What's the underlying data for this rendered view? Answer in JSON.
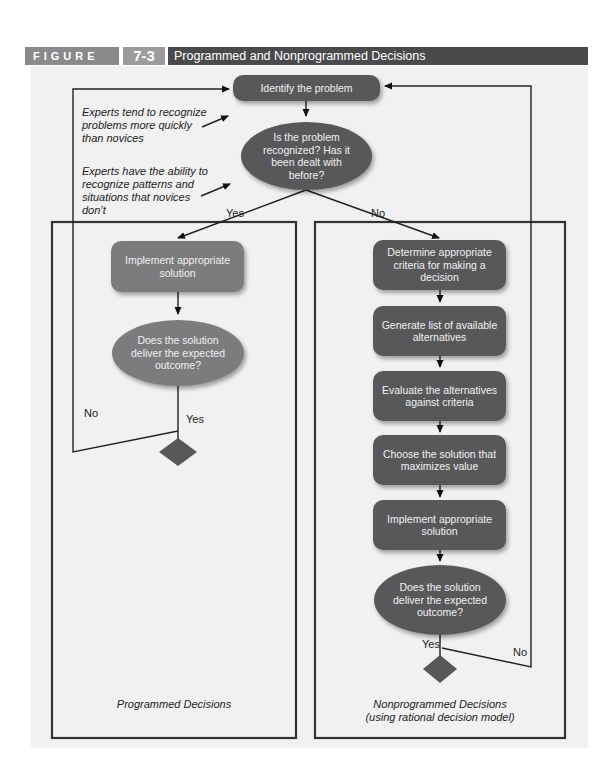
{
  "header": {
    "figure_label": "FIGURE",
    "figure_number": "7-3",
    "title": "Programmed and Nonprogrammed Decisions"
  },
  "colors": {
    "dark_node": "#58585b",
    "light_node": "#7c7c7f",
    "background": "#f1f1f1",
    "header_band": "#4a4a4c"
  },
  "top": {
    "start": "Identify the problem",
    "decision": "Is the problem recognized? Has it been dealt with before?",
    "yes_label": "Yes",
    "no_label": "No"
  },
  "notes": [
    "Experts tend to recognize problems more quickly than novices",
    "Experts have the ability to recognize patterns and situations that novices don’t"
  ],
  "programmed": {
    "caption": "Programmed Decisions",
    "steps": [
      "Implement appropriate solution"
    ],
    "decision": "Does the solution deliver the expected outcome?",
    "yes_label": "Yes",
    "no_label": "No"
  },
  "nonprogrammed": {
    "caption_line1": "Nonprogrammed Decisions",
    "caption_line2": "(using rational decision model)",
    "steps": [
      "Determine appropriate criteria for making a decision",
      "Generate list of available alternatives",
      "Evaluate the alternatives against criteria",
      "Choose the solution that maximizes value",
      "Implement appropriate solution"
    ],
    "decision": "Does the solution deliver the expected outcome?",
    "yes_label": "Yes",
    "no_label": "No"
  }
}
